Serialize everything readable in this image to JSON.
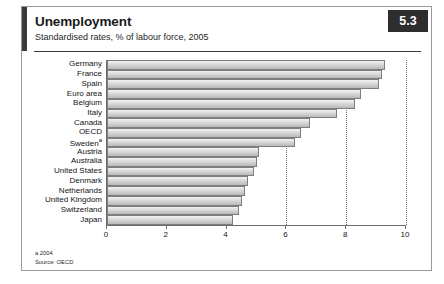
{
  "figure": {
    "badge": "5.3",
    "title": "Unemployment",
    "subtitle": "Standardised rates, % of labour force, 2005",
    "footnote_a": "a 2004",
    "footnote_source": "Source: OECD",
    "accent_color": "#2e2e2e",
    "bar_fill_color": "#d8d8d8",
    "bar_border_color": "#7e7e7e",
    "frame_color": "#9a9a9a"
  },
  "chart_data": {
    "type": "bar",
    "orientation": "horizontal",
    "title": "Unemployment",
    "subtitle": "Standardised rates, % of labour force, 2005",
    "xlabel": "",
    "ylabel": "",
    "xlim": [
      0,
      10
    ],
    "xticks": [
      0,
      2,
      4,
      6,
      8,
      10
    ],
    "xtick_labels": [
      "0",
      "2",
      "4",
      "6",
      "8",
      "10"
    ],
    "grid": "vertical dotted at ticks",
    "legend": "none",
    "categories": [
      "Germany",
      "France",
      "Spain",
      "Euro area",
      "Belgium",
      "Italy",
      "Canada",
      "OECD",
      "Sweden",
      "Austria",
      "Australia",
      "United States",
      "Denmark",
      "Netherlands",
      "United Kingdom",
      "Switzerland",
      "Japan"
    ],
    "category_footnotes": {
      "Sweden": "a"
    },
    "values": [
      9.3,
      9.2,
      9.1,
      8.5,
      8.3,
      7.7,
      6.8,
      6.5,
      6.3,
      5.1,
      5.0,
      4.9,
      4.7,
      4.6,
      4.5,
      4.4,
      4.2
    ],
    "units": "% of labour force",
    "source": "OECD"
  }
}
